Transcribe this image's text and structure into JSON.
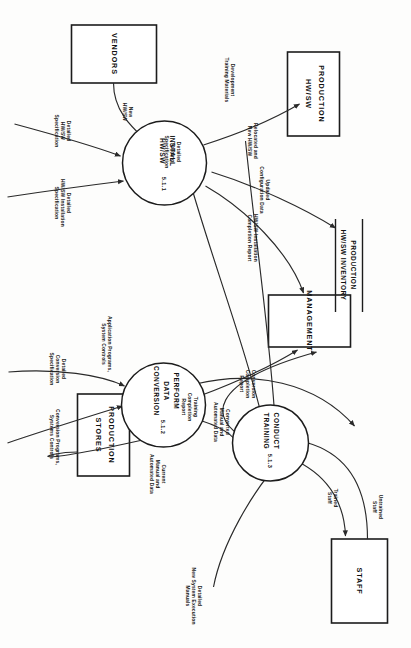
{
  "diagram": {
    "type": "data-flow-diagram",
    "orientation_degrees": 90,
    "page_background": "#fdfdfc",
    "ink_color": "#1c1c1c"
  },
  "processes": [
    {
      "id": "p511",
      "number": "5.1.1",
      "line1": "INSTALL",
      "line2": "HW/SW",
      "line3": ""
    },
    {
      "id": "p512",
      "number": "5.1.2",
      "line1": "PERFORM",
      "line2": "DATA",
      "line3": "CONVERSION"
    },
    {
      "id": "p513",
      "number": "5.1.3",
      "line1": "CONDUCT",
      "line2": "TRAINING",
      "line3": ""
    }
  ],
  "entities": [
    {
      "id": "e_vendors",
      "line1": "VENDORS",
      "line2": ""
    },
    {
      "id": "e_prod_hwsw",
      "line1": "PRODUCTION",
      "line2": "HW/SW"
    },
    {
      "id": "e_management",
      "line1": "MANAGEMENT",
      "line2": ""
    },
    {
      "id": "e_prod_stores",
      "line1": "PRODUCTION",
      "line2": "STORES"
    },
    {
      "id": "e_staff",
      "line1": "STAFF",
      "line2": ""
    }
  ],
  "datastores": [
    {
      "id": "d_inventory",
      "line1": "PRODUCTION",
      "line2": "HW/SW INVENTORY"
    }
  ],
  "flows": [
    {
      "id": "f_new_hwsw",
      "line1": "New",
      "line2": "HW/SW",
      "line3": ""
    },
    {
      "id": "f_detailed_hwsw_spec",
      "line1": "Detailed",
      "line2": "HW/SW",
      "line3": "Specification"
    },
    {
      "id": "f_detailed_hwsw_install_spec",
      "line1": "Detailed",
      "line2": "HW/SW Installation",
      "line3": "Specification"
    },
    {
      "id": "f_relocated_new_hwsw",
      "line1": "Relocated and",
      "line2": "New HW/SW",
      "line3": ""
    },
    {
      "id": "f_updated_config",
      "line1": "Updated",
      "line2": "Configuration Data",
      "line3": ""
    },
    {
      "id": "f_hwsw_install_report",
      "line1": "HW/SW Installation",
      "line2": "Completion Report",
      "line3": ""
    },
    {
      "id": "f_detailed_conv_spec",
      "line1": "Detailed",
      "line2": "Conversion",
      "line3": "Specification"
    },
    {
      "id": "f_conv_prog_controls",
      "line1": "Conversion  Programs,",
      "line2": "Systems Controls",
      "line3": ""
    },
    {
      "id": "f_current_manual_auto",
      "line1": "Current",
      "line2": "Manual and",
      "line3": "Automated Data"
    },
    {
      "id": "f_converted_manual_auto",
      "line1": "Converted",
      "line2": "Manual and",
      "line3": "Automated Data"
    },
    {
      "id": "f_conv_completion_report",
      "line1": "Conversion",
      "line2": "Completion",
      "line3": "Report"
    },
    {
      "id": "f_app_prog_controls",
      "line1": "Application Programs,",
      "line2": "System Controls",
      "line3": ""
    },
    {
      "id": "f_detailed_exec_manuals",
      "line1": "Detailed",
      "line2": "New System Execution",
      "line3": "Manuals"
    },
    {
      "id": "f_development_training",
      "line1": "Development",
      "line2": "Training Materials",
      "line3": ""
    },
    {
      "id": "f_detailed_training_spec",
      "line1": "Detailed",
      "line2": "Training",
      "line3": "Specification"
    },
    {
      "id": "f_training_completion_report",
      "line1": "Training",
      "line2": "Completion",
      "line3": "Report"
    },
    {
      "id": "f_untrained_staff",
      "line1": "Untrained",
      "line2": "Staff",
      "line3": ""
    },
    {
      "id": "f_trained_staff",
      "line1": "Trained",
      "line2": "Staff",
      "line3": ""
    }
  ]
}
